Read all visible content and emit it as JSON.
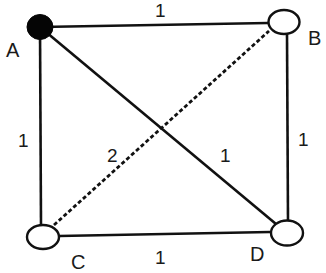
{
  "graph": {
    "nodes": [
      {
        "id": "A",
        "label": "A",
        "filled": true
      },
      {
        "id": "B",
        "label": "B",
        "filled": false
      },
      {
        "id": "C",
        "label": "C",
        "filled": false
      },
      {
        "id": "D",
        "label": "D",
        "filled": false
      }
    ],
    "edges": [
      {
        "from": "A",
        "to": "B",
        "weight": "1",
        "style": "solid"
      },
      {
        "from": "A",
        "to": "C",
        "weight": "1",
        "style": "solid"
      },
      {
        "from": "A",
        "to": "D",
        "weight": "1",
        "style": "solid"
      },
      {
        "from": "B",
        "to": "D",
        "weight": "1",
        "style": "solid"
      },
      {
        "from": "C",
        "to": "D",
        "weight": "1",
        "style": "solid"
      },
      {
        "from": "C",
        "to": "B",
        "weight": "2",
        "style": "dashed"
      }
    ],
    "colors": {
      "line": "#111111",
      "filled_node": "#050505",
      "background": "#ffffff"
    }
  }
}
